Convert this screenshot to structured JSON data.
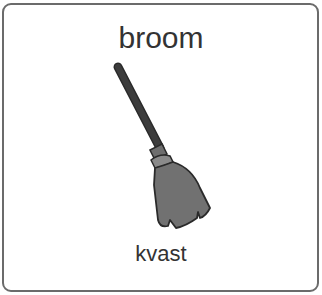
{
  "card": {
    "title": "broom",
    "subtitle": "kvast",
    "image": {
      "icon": "broom-icon",
      "colors": {
        "handle": "#3c3c3c",
        "collar": "#6e6e6e",
        "collar_band": "#8a8a8a",
        "bristles": "#717171",
        "outline": "#2a2a2a"
      }
    },
    "border_color": "#6b6b6b"
  }
}
